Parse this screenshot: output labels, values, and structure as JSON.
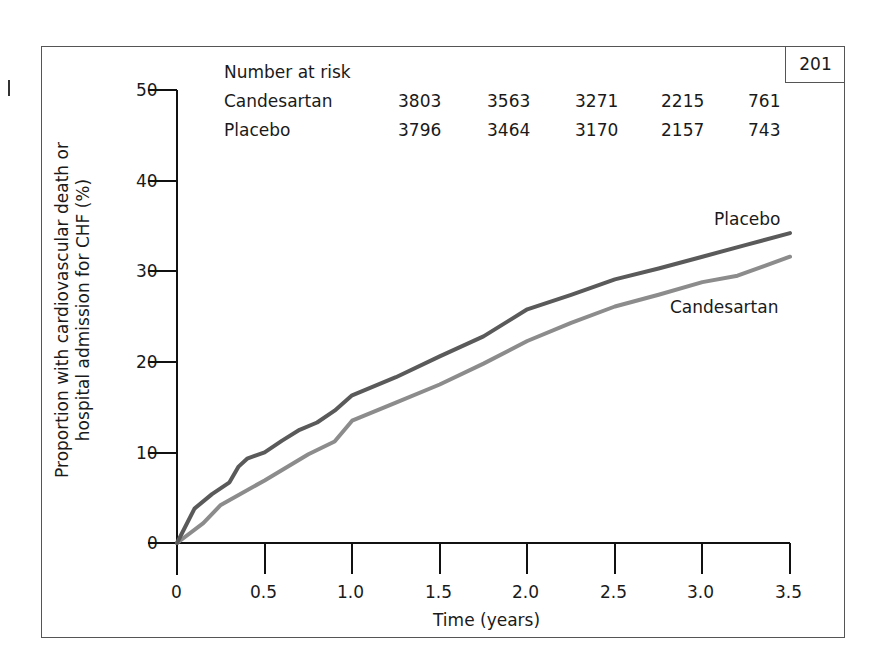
{
  "page_number": "201",
  "risk_table": {
    "title": "Number at risk",
    "rows": [
      {
        "label": "Candesartan",
        "values": [
          "3803",
          "3563",
          "3271",
          "2215",
          "761"
        ]
      },
      {
        "label": "Placebo",
        "values": [
          "3796",
          "3464",
          "3170",
          "2157",
          "743"
        ]
      }
    ]
  },
  "axes": {
    "ylabel_line1": "Proportion with cardiovascular death or",
    "ylabel_line2": "hospital admission for CHF (%)",
    "xlabel": "Time (years)",
    "yticks": [
      "0",
      "10",
      "20",
      "30",
      "40",
      "50"
    ],
    "xticks": [
      "0",
      "0.5",
      "1.0",
      "1.5",
      "2.0",
      "2.5",
      "3.0",
      "3.5"
    ]
  },
  "labels": {
    "placebo": "Placebo",
    "candesartan": "Candesartan"
  },
  "colors": {
    "placebo": "#5a5a5a",
    "candesartan": "#8c8c8c",
    "axis": "#111111"
  },
  "chart_data": {
    "type": "line",
    "title": "",
    "xlabel": "Time (years)",
    "ylabel": "Proportion with cardiovascular death or hospital admission for CHF (%)",
    "xlim": [
      0,
      3.5
    ],
    "ylim": [
      0,
      50
    ],
    "xticks": [
      0,
      0.5,
      1.0,
      1.5,
      2.0,
      2.5,
      3.0,
      3.5
    ],
    "yticks": [
      0,
      10,
      20,
      30,
      40,
      50
    ],
    "grid": false,
    "legend": "inline labels at right end of curves",
    "series": [
      {
        "name": "Placebo",
        "x": [
          0,
          0.1,
          0.2,
          0.3,
          0.35,
          0.4,
          0.5,
          0.6,
          0.7,
          0.8,
          0.9,
          1.0,
          1.25,
          1.5,
          1.75,
          1.9,
          2.0,
          2.25,
          2.5,
          2.75,
          3.0,
          3.25,
          3.5
        ],
        "y": [
          0,
          3.8,
          5.4,
          6.7,
          8.4,
          9.3,
          10.0,
          11.3,
          12.5,
          13.3,
          14.6,
          16.3,
          18.3,
          20.6,
          22.8,
          24.6,
          25.8,
          27.4,
          29.1,
          30.3,
          31.6,
          32.9,
          34.2
        ]
      },
      {
        "name": "Candesartan",
        "x": [
          0,
          0.15,
          0.25,
          0.5,
          0.75,
          0.9,
          1.0,
          1.25,
          1.5,
          1.75,
          2.0,
          2.25,
          2.5,
          2.75,
          3.0,
          3.2,
          3.5
        ],
        "y": [
          0,
          2.2,
          4.2,
          6.9,
          9.8,
          11.2,
          13.5,
          15.5,
          17.5,
          19.8,
          22.3,
          24.3,
          26.1,
          27.4,
          28.8,
          29.5,
          31.6
        ]
      }
    ],
    "number_at_risk": {
      "x": [
        0,
        0.75,
        1.5,
        2.25,
        3.0
      ],
      "Candesartan": [
        3803,
        3563,
        3271,
        2215,
        761
      ],
      "Placebo": [
        3796,
        3464,
        3170,
        2157,
        743
      ]
    }
  }
}
